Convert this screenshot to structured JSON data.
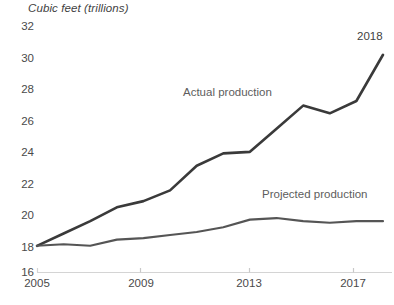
{
  "chart_data": {
    "type": "line",
    "title": "Cubic feet (trillions)",
    "xlabel": "",
    "ylabel": "Cubic feet (trillions)",
    "ylim": [
      16,
      32
    ],
    "xlim": [
      2005,
      2018
    ],
    "grid": false,
    "legend_position": "inline-annotation",
    "y_ticks": [
      32,
      30,
      28,
      26,
      24,
      22,
      20,
      18,
      16
    ],
    "x_ticks": [
      2005,
      2009,
      2013,
      2017
    ],
    "x": [
      2005,
      2006,
      2007,
      2008,
      2009,
      2010,
      2011,
      2012,
      2013,
      2014,
      2015,
      2016,
      2017,
      2018
    ],
    "series": [
      {
        "name": "Actual production",
        "color": "#3a3a3a",
        "values": [
          17.7,
          18.5,
          19.3,
          20.2,
          20.6,
          21.3,
          22.9,
          23.7,
          23.8,
          25.3,
          26.8,
          26.3,
          27.1,
          30.1
        ]
      },
      {
        "name": "Projected production",
        "color": "#555555",
        "values": [
          17.7,
          17.8,
          17.7,
          18.1,
          18.2,
          18.4,
          18.6,
          18.9,
          19.4,
          19.5,
          19.3,
          19.2,
          19.3,
          19.3
        ]
      }
    ],
    "annotations": [
      {
        "text": "2018",
        "x": 2018,
        "y": 31.2
      },
      {
        "text": "Actual production",
        "x": 2012,
        "y": 27.2
      },
      {
        "text": "Projected production",
        "x": 2016.1,
        "y": 21.1
      }
    ]
  },
  "labels": {
    "axis_title": "Cubic feet (trillions)",
    "y_ticks": [
      "32",
      "30",
      "28",
      "26",
      "24",
      "22",
      "20",
      "18",
      "16"
    ],
    "x_ticks": [
      "2005",
      "2009",
      "2013",
      "2017"
    ],
    "actual_series_label": "Actual production",
    "projected_series_label": "Projected production",
    "end_point_annotation": "2018"
  },
  "colors": {
    "actual_line": "#3a3a3a",
    "projected_line": "#555555",
    "axis": "#d4d4d4",
    "text": "#4a4a4a"
  }
}
